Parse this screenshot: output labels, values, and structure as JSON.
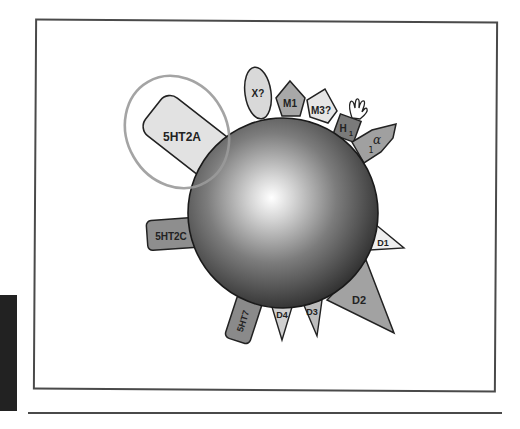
{
  "figure": {
    "type": "receptor-binding-diagram",
    "center": {
      "shape": "sphere",
      "fill_highlight": "#ffffff",
      "fill_shadow": "#2b2b2b"
    },
    "highlight_ring": {
      "target": "5HT2A",
      "color": "#9a9a9a"
    },
    "receptors": [
      {
        "id": "5HT2A",
        "label": "5HT2A",
        "shape": "rounded-rect",
        "fill": "#e2e2e2"
      },
      {
        "id": "X",
        "label": "X?",
        "shape": "ellipse",
        "fill": "#d9d9d9"
      },
      {
        "id": "M1",
        "label": "M1",
        "shape": "pentagon",
        "fill": "#a8a8a8"
      },
      {
        "id": "M3",
        "label": "M3?",
        "shape": "pentagon",
        "fill": "#e6e6e6"
      },
      {
        "id": "H1",
        "label_main": "H",
        "label_sub": "1",
        "shape": "rect",
        "fill": "#7a7a7a"
      },
      {
        "id": "alpha1",
        "label_main": "α",
        "label_sub": "1",
        "shape": "arrow-pentagon",
        "fill": "#a0a0a0"
      },
      {
        "id": "5HT2C",
        "label": "5HT2C",
        "shape": "rounded-rect",
        "fill": "#8e8e8e"
      },
      {
        "id": "D1",
        "label": "D1",
        "shape": "triangle",
        "fill": "#eeeeee"
      },
      {
        "id": "D2",
        "label": "D2",
        "shape": "triangle",
        "fill": "#a2a2a2"
      },
      {
        "id": "D3",
        "label": "D3",
        "shape": "triangle",
        "fill": "#bdbdbd"
      },
      {
        "id": "D4",
        "label": "D4",
        "shape": "triangle",
        "fill": "#cfcfcf"
      },
      {
        "id": "5HT7",
        "label": "5HT7",
        "shape": "rounded-rect",
        "fill": "#8a8a8a"
      }
    ],
    "decorations": [
      {
        "id": "hand",
        "near": "H1",
        "shape": "hand-outline"
      }
    ]
  }
}
